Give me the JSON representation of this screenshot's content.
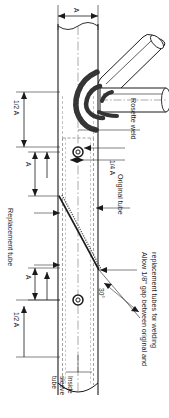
{
  "drawing": {
    "title": "Tube splice repair detail",
    "orientation_note": "labels rotated 90 degrees clockwise",
    "line_color": "#1a1a1a",
    "fill_color": "#ffffff",
    "hatch_color": "#555555",
    "hidden_line_color": "#777777"
  },
  "dimensions": {
    "top_a": "A",
    "half_a_top": "1/2 A",
    "quarter_a": "1/4 A",
    "a_upper": "A",
    "a_lower": "A",
    "half_a_bottom": "1/2 A",
    "angle": "30°"
  },
  "labels": {
    "rosette_weld": "Rosette weld",
    "original_tube": "Original tube",
    "replacement_tube": "Replacement tube",
    "inside_sleeve": [
      "Inside",
      "sleeve",
      "tube"
    ],
    "gap_note": [
      "Allow 1/8\" gap between original and",
      "replacement tubes for welding"
    ]
  }
}
